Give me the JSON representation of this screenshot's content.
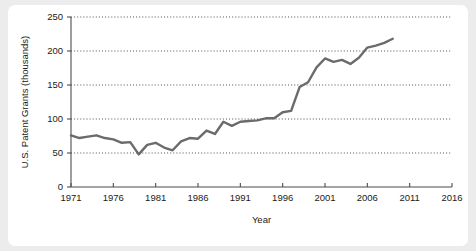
{
  "figure": {
    "background_color": "#ececec",
    "panel_color": "#ffffff"
  },
  "chart_data": {
    "type": "line",
    "title": "",
    "xlabel": "Year",
    "ylabel": "U.S. Patent Grants (thousands)",
    "xlim": [
      1971,
      2016
    ],
    "ylim": [
      0,
      250
    ],
    "xticks": [
      1971,
      1976,
      1981,
      1986,
      1991,
      1996,
      2001,
      2006,
      2011,
      2016
    ],
    "xtick_labels": [
      "1971",
      "1976",
      "1981",
      "1986",
      "1991",
      "1996",
      "2001",
      "2006",
      "2011",
      "2016"
    ],
    "yticks": [
      0,
      50,
      100,
      150,
      200,
      250
    ],
    "ytick_labels": [
      "0",
      "50",
      "100",
      "150",
      "200",
      "250"
    ],
    "grid": "horizontal-dotted",
    "grid_values": [
      50,
      100,
      150,
      200,
      250
    ],
    "legend": "none",
    "line_color": "#6b6b6b",
    "line_width": 2.4,
    "series": [
      {
        "name": "U.S. Patent Grants",
        "x": [
          1971,
          1972,
          1973,
          1974,
          1975,
          1976,
          1977,
          1978,
          1979,
          1980,
          1981,
          1982,
          1983,
          1984,
          1985,
          1986,
          1987,
          1988,
          1989,
          1990,
          1991,
          1992,
          1993,
          1994,
          1995,
          1996,
          1997,
          1998,
          1999,
          2000,
          2001,
          2002,
          2003,
          2004,
          2005,
          2006,
          2007,
          2008,
          2009
        ],
        "values": [
          76,
          72,
          74,
          76,
          72,
          70,
          65,
          66,
          48,
          62,
          65,
          58,
          54,
          67,
          72,
          71,
          83,
          78,
          96,
          90,
          96,
          97,
          98,
          101,
          101,
          110,
          112,
          147,
          154,
          176,
          189,
          184,
          187,
          181,
          190,
          205,
          208,
          212,
          218
        ]
      }
    ]
  }
}
